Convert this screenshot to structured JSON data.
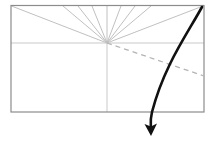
{
  "diagram": {
    "title": "",
    "canvas": {
      "width": 214,
      "height": 142,
      "background": "#ffffff"
    },
    "colors": {
      "frame": "#8c8c8c",
      "fan_lines": "#b9b9b9",
      "axis_lines": "#c9c9c9",
      "dashed_line": "#b4b4b4",
      "arrow_curve": "#111111"
    },
    "frame": {
      "label": "rectangle-frame",
      "x": 11,
      "y": 5.5,
      "width": 193,
      "height": 106.5,
      "stroke_width": 1.2
    },
    "origin": {
      "label": "fan-convergence-point",
      "x": 107,
      "y": 43
    },
    "axes": {
      "horizontal": {
        "label": "horizontal-axis-line",
        "x1": 11,
        "y1": 43,
        "x2": 204,
        "y2": 43
      },
      "vertical": {
        "label": "vertical-axis-line",
        "x1": 107,
        "y1": 43,
        "x2": 107,
        "y2": 112
      }
    },
    "fan_rays": [
      {
        "label": "ray-to-top-left-corner",
        "x2": 11.5,
        "y2": 6
      },
      {
        "label": "ray-1",
        "x2": 63,
        "y2": 6
      },
      {
        "label": "ray-2",
        "x2": 78,
        "y2": 6
      },
      {
        "label": "ray-3",
        "x2": 92,
        "y2": 6
      },
      {
        "label": "ray-4",
        "x2": 107,
        "y2": 6
      },
      {
        "label": "ray-5",
        "x2": 121,
        "y2": 6
      },
      {
        "label": "ray-6",
        "x2": 135,
        "y2": 6
      },
      {
        "label": "ray-7",
        "x2": 151,
        "y2": 6
      },
      {
        "label": "ray-to-top-right-corner",
        "x2": 203,
        "y2": 6
      }
    ],
    "dashed_line": {
      "label": "dashed-trajectory-line",
      "x1": 107,
      "y1": 43,
      "x2": 204,
      "y2": 76,
      "dash_pattern": "5,4",
      "stroke_width": 1.3
    },
    "curved_arrow": {
      "label": "bold-curved-arrow",
      "path": "M 202 7 C 186 36, 164 66, 152 112 C 150.5 118, 150.5 123, 150.8 127",
      "stroke_width": 2.6,
      "arrowhead": {
        "label": "arrowhead",
        "points": "144.5,124 151,136 157,123.5 150.9,126.5"
      }
    }
  }
}
